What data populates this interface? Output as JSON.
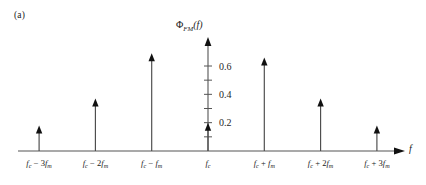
{
  "figure": {
    "panel_label": "(a)",
    "y_axis_label": "Φ",
    "y_axis_label_sub": "FM",
    "y_axis_label_arg": "(f)",
    "x_axis_label": "f",
    "background_color": "#ffffff",
    "line_color": "#4a4a4a",
    "text_color": "#1a1a1a"
  },
  "chart_data": {
    "type": "bar",
    "title": "",
    "subtitle": "",
    "xlabel": "f",
    "ylabel": "ΦFM(f)",
    "grid": false,
    "legend": null,
    "categories": [
      "f_c - 3f_m",
      "f_c - 2f_m",
      "f_c - f_m",
      "f_c",
      "f_c + f_m",
      "f_c + 2f_m",
      "f_c + 3f_m"
    ],
    "category_labels": [
      {
        "base": "f",
        "base_sub": "c",
        "op": "−",
        "coef": "3",
        "term": "f",
        "term_sub": "m"
      },
      {
        "base": "f",
        "base_sub": "c",
        "op": "−",
        "coef": "2",
        "term": "f",
        "term_sub": "m"
      },
      {
        "base": "f",
        "base_sub": "c",
        "op": "−",
        "coef": "",
        "term": "f",
        "term_sub": "m"
      },
      {
        "base": "f",
        "base_sub": "c",
        "op": "",
        "coef": "",
        "term": "",
        "term_sub": ""
      },
      {
        "base": "f",
        "base_sub": "c",
        "op": "+",
        "coef": "",
        "term": "f",
        "term_sub": "m"
      },
      {
        "base": "f",
        "base_sub": "c",
        "op": "+",
        "coef": "2",
        "term": "f",
        "term_sub": "m"
      },
      {
        "base": "f",
        "base_sub": "c",
        "op": "+",
        "coef": "3",
        "term": "f",
        "term_sub": "m"
      }
    ],
    "values": [
      0.18,
      0.37,
      0.69,
      0.2,
      0.66,
      0.37,
      0.18
    ],
    "ylim": [
      0,
      0.72
    ],
    "yticks": [
      0.1,
      0.2,
      0.3,
      0.4,
      0.5,
      0.6
    ],
    "ytick_labels": [
      "",
      "0.2",
      "",
      "0.4",
      "",
      "0.6"
    ],
    "ytick_labels_shown": [
      "0.2",
      "0.4",
      "0.6"
    ],
    "xlim": [
      0,
      8
    ]
  }
}
